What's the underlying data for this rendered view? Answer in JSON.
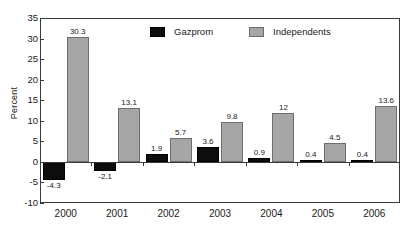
{
  "chart_data": {
    "type": "bar",
    "title": "",
    "xlabel": "",
    "ylabel": "Percent",
    "ylim": [
      -10,
      35
    ],
    "ytick_step": 5,
    "yticks": [
      35,
      30,
      25,
      20,
      15,
      10,
      5,
      0,
      -5,
      -10
    ],
    "ytick_labels": [
      "35",
      "30",
      "25",
      "20",
      "15",
      "10",
      "5",
      "0",
      "-5",
      "-10"
    ],
    "categories": [
      "2000",
      "2001",
      "2002",
      "2003",
      "2004",
      "2005",
      "2006"
    ],
    "grid": false,
    "legend_position": "top-center-inside",
    "series": [
      {
        "name": "Gazprom",
        "color": "#0d0d0d",
        "values": [
          -4.3,
          -2.1,
          1.9,
          3.6,
          0.9,
          0.4,
          0.4
        ],
        "labels": [
          "-4.3",
          "-2.1",
          "1.9",
          "3.6",
          "0.9",
          "0.4",
          "0.4"
        ]
      },
      {
        "name": "Independents",
        "color": "#a6a6a6",
        "values": [
          30.3,
          13.1,
          5.7,
          9.8,
          12,
          4.5,
          13.6
        ],
        "labels": [
          "30.3",
          "13.1",
          "5.7",
          "9.8",
          "12",
          "4.5",
          "13.6"
        ]
      }
    ]
  },
  "legend": {
    "entries": [
      {
        "label": "Gazprom",
        "color": "#0d0d0d"
      },
      {
        "label": "Independents",
        "color": "#a6a6a6"
      }
    ]
  },
  "axis": {
    "y_title": "Percent"
  },
  "colors": {
    "gazprom": "#0d0d0d",
    "independents": "#a6a6a6",
    "frame": "#3a3a3a",
    "text": "#1a1a1a",
    "background": "#ffffff"
  }
}
